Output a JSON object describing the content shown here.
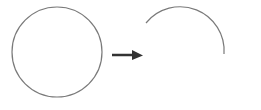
{
  "diagram": {
    "colors": {
      "stroke": "#7a7a7a",
      "arrow": "#333333",
      "background": "#ffffff"
    },
    "circle": {
      "cx": 57,
      "cy": 52,
      "r": 45
    },
    "arrow": {
      "x1": 112,
      "y1": 55,
      "x2": 142,
      "y2": 55
    },
    "arc": {
      "cx": 180,
      "cy": 53,
      "r": 44,
      "start": [
        146,
        24
      ],
      "end": [
        224,
        53
      ]
    }
  }
}
